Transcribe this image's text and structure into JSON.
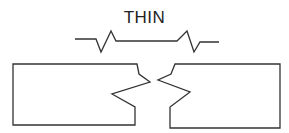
{
  "diagram": {
    "title": "THIN",
    "break_symbol": "long-break-line",
    "parts": [
      "left-fractured-block",
      "right-fractured-block"
    ],
    "stroke_color": "#333333",
    "background": "#ffffff"
  }
}
